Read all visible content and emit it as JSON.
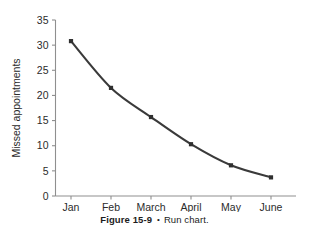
{
  "figure": {
    "caption_number": "Figure 15-9",
    "caption_separator": "•",
    "caption_text": "Run chart."
  },
  "colors": {
    "line": "#3a3a3a",
    "marker": "#2f2f2f",
    "axis": "#8f8f8f",
    "text": "#2b2b2b",
    "background": "#ffffff"
  },
  "chart_data": {
    "type": "line",
    "title": "",
    "subtitle": "",
    "xlabel": "",
    "ylabel": "Missed appointments",
    "categories": [
      "Jan",
      "Feb",
      "March",
      "April",
      "May",
      "June"
    ],
    "values": [
      30.8,
      21.5,
      15.7,
      10.3,
      6.1,
      3.7
    ],
    "series": [
      {
        "name": "Missed appointments",
        "values": [
          30.8,
          21.5,
          15.7,
          10.3,
          6.1,
          3.7
        ]
      }
    ],
    "yticks": [
      0,
      5,
      10,
      15,
      20,
      25,
      30,
      35
    ],
    "yticklabels": [
      "0",
      "5",
      "10",
      "15",
      "20",
      "25",
      "30",
      "35"
    ],
    "ylim": [
      0,
      35
    ],
    "grid": false,
    "legend": false,
    "legend_position": "none",
    "marker": "square",
    "annotations": []
  }
}
